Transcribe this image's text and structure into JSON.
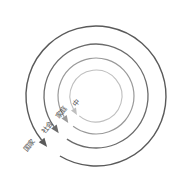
{
  "figure": {
    "type": "concentric-spiral-diagram",
    "background_color": "#ffffff",
    "center": {
      "x": 96,
      "y": 96
    }
  },
  "chart_data": {
    "type": "diagram",
    "title": "",
    "subtitle": "",
    "xlabel": "",
    "ylabel": "",
    "legend": [],
    "annotations": [],
    "rings": [
      {
        "index": 1,
        "label": "中",
        "radius": 26,
        "color": "#bfbfbf",
        "stroke_width": 1.1,
        "label_rotation": -52,
        "label_font_size": 7,
        "label_x": 77,
        "label_y": 103,
        "arrow_color": "#bfbfbf"
      },
      {
        "index": 2,
        "label": "家庭",
        "radius": 38,
        "color": "#9a9a9a",
        "stroke_width": 1.2,
        "label_rotation": -52,
        "label_font_size": 7,
        "label_x": 62,
        "label_y": 113,
        "arrow_color": "#9a9a9a"
      },
      {
        "index": 3,
        "label": "社会",
        "radius": 52,
        "color": "#6b6b6b",
        "stroke_width": 1.3,
        "label_rotation": -52,
        "label_font_size": 7,
        "label_x": 48,
        "label_y": 128,
        "arrow_color": "#6b6b6b"
      },
      {
        "index": 4,
        "label": "国家",
        "radius": 70,
        "color": "#5a5a5a",
        "stroke_width": 1.4,
        "label_rotation": -52,
        "label_font_size": 7,
        "label_x": 30,
        "label_y": 146,
        "arrow_color": "#5a5a5a"
      }
    ],
    "arrow_direction": "counterclockwise-inward"
  }
}
